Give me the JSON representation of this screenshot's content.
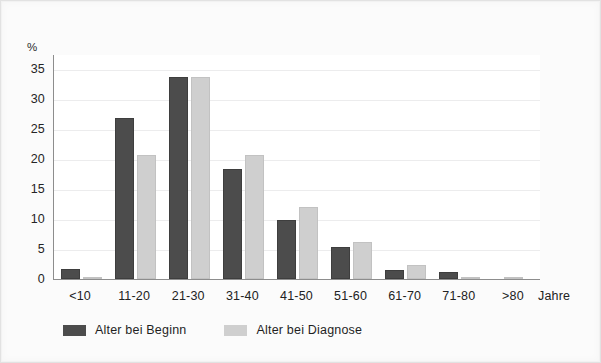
{
  "chart_data": {
    "type": "bar",
    "title": "",
    "subtitle": "",
    "xlabel": "Jahre",
    "ylabel": "%",
    "ylim": [
      0,
      37.5
    ],
    "yticks": [
      0,
      5,
      10,
      15,
      20,
      25,
      30,
      35
    ],
    "grid": true,
    "legend_position": "bottom-left",
    "categories": [
      "<10",
      "11-20",
      "21-30",
      "31-40",
      "41-50",
      "51-60",
      "61-70",
      "71-80",
      ">80"
    ],
    "series": [
      {
        "name": "Alter bei Beginn",
        "color": "#4c4c4c",
        "values": [
          1.6,
          26.9,
          33.6,
          18.4,
          9.9,
          5.3,
          1.5,
          1.1,
          0.0
        ]
      },
      {
        "name": "Alter bei Diagnose",
        "color": "#cfcfcf",
        "values": [
          0.3,
          20.6,
          33.6,
          20.6,
          12.0,
          6.2,
          2.3,
          0.4,
          0.4
        ]
      }
    ]
  },
  "axes": {
    "y_unit_label": "%",
    "x_unit_label": "Jahre"
  },
  "colors": {
    "series_begin": "#4c4c4c",
    "series_diagnose": "#cfcfcf",
    "axis": "#8d8d8d",
    "gridline": "#ececed",
    "plot_background": "#ffffff",
    "page_background": "#fbfbfb"
  }
}
